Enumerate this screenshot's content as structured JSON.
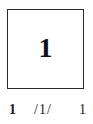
{
  "box": {
    "value": "1"
  },
  "footer": {
    "left": "1",
    "middle": "/1/",
    "right": "1"
  },
  "colors": {
    "border": "#2a2a2a",
    "text": "#111111",
    "background": "#ffffff"
  }
}
